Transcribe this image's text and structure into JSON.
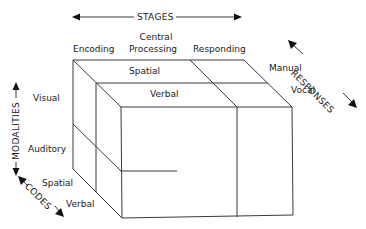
{
  "axes": {
    "stages": "STAGES",
    "responses": "RESPONSES",
    "modalities": "MODALITIES",
    "codes": "CODES"
  },
  "stages": [
    "Encoding",
    "Central",
    "Processing",
    "Responding"
  ],
  "codes_top": [
    "Spatial",
    "Verbal"
  ],
  "responses": [
    "Manual",
    "Vocal"
  ],
  "modalities": [
    "Visual",
    "Auditory"
  ],
  "codes_side": [
    "Spatial",
    "Verbal"
  ],
  "colors": {
    "line": "#3a3a3a",
    "text": "#1a1a1a",
    "background": "#ffffff"
  }
}
